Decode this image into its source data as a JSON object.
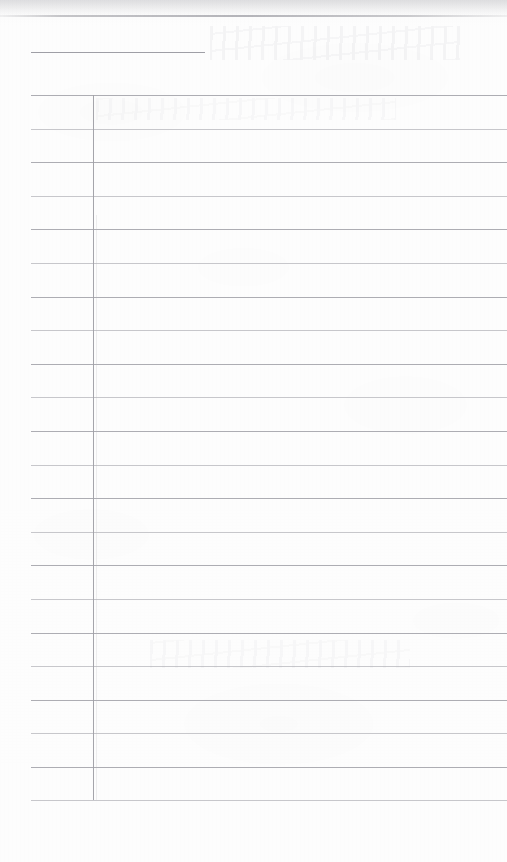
{
  "document": {
    "kind": "scanned-blank-ruled-form",
    "page_background_color": "#fdfdfd",
    "rule_color": "#a6a6ac",
    "header_rule_color": "#9a9aa1",
    "page_width": 507,
    "page_height": 862,
    "title_text": "",
    "visible_text": "",
    "notes_text": ""
  },
  "header": {
    "rule": {
      "x": 31,
      "y": 52,
      "width": 174
    },
    "title_label": "",
    "subtitle_label": ""
  },
  "scan_artifacts": {
    "top_edge_line_y": 15,
    "top_edge_label": "",
    "bleed_through_label": ""
  },
  "table": {
    "left": 31,
    "top": 95,
    "bottom": 800,
    "right_edge": 507,
    "divider_x": 93,
    "row_height": 33.6,
    "row_count": 21,
    "columns": [
      {
        "name": "label-column",
        "header": "",
        "left": 31,
        "right": 93
      },
      {
        "name": "entry-column",
        "header": "",
        "left": 93,
        "right": 507
      }
    ],
    "horizontal_rule_y": [
      95,
      128.6,
      162.2,
      195.8,
      229.4,
      263,
      296.6,
      330.2,
      363.8,
      397.4,
      431,
      464.6,
      498.2,
      531.8,
      565.4,
      599,
      632.6,
      666.2,
      699.8,
      733.4,
      767,
      800
    ],
    "rows": [
      {
        "label": "",
        "value": ""
      },
      {
        "label": "",
        "value": ""
      },
      {
        "label": "",
        "value": ""
      },
      {
        "label": "",
        "value": ""
      },
      {
        "label": "",
        "value": ""
      },
      {
        "label": "",
        "value": ""
      },
      {
        "label": "",
        "value": ""
      },
      {
        "label": "",
        "value": ""
      },
      {
        "label": "",
        "value": ""
      },
      {
        "label": "",
        "value": ""
      },
      {
        "label": "",
        "value": ""
      },
      {
        "label": "",
        "value": ""
      },
      {
        "label": "",
        "value": ""
      },
      {
        "label": "",
        "value": ""
      },
      {
        "label": "",
        "value": ""
      },
      {
        "label": "",
        "value": ""
      },
      {
        "label": "",
        "value": ""
      },
      {
        "label": "",
        "value": ""
      },
      {
        "label": "",
        "value": ""
      },
      {
        "label": "",
        "value": ""
      },
      {
        "label": "",
        "value": ""
      }
    ]
  },
  "footer": {
    "margin_top": 800,
    "text": ""
  }
}
